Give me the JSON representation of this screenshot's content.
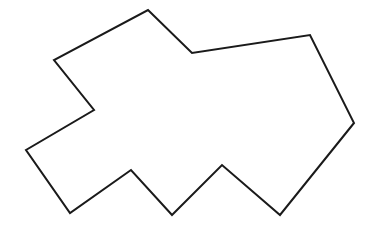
{
  "diagram": {
    "type": "polygon",
    "background": "#ffffff",
    "stroke": "#1a1a1a",
    "stroke_width": 2,
    "fill": "none",
    "vertices": [
      [
        148,
        10
      ],
      [
        192,
        53
      ],
      [
        310,
        35
      ],
      [
        354,
        123
      ],
      [
        280,
        215
      ],
      [
        222,
        165
      ],
      [
        172,
        215
      ],
      [
        131,
        170
      ],
      [
        70,
        213
      ],
      [
        26,
        150
      ],
      [
        94,
        110
      ],
      [
        54,
        60
      ]
    ]
  }
}
